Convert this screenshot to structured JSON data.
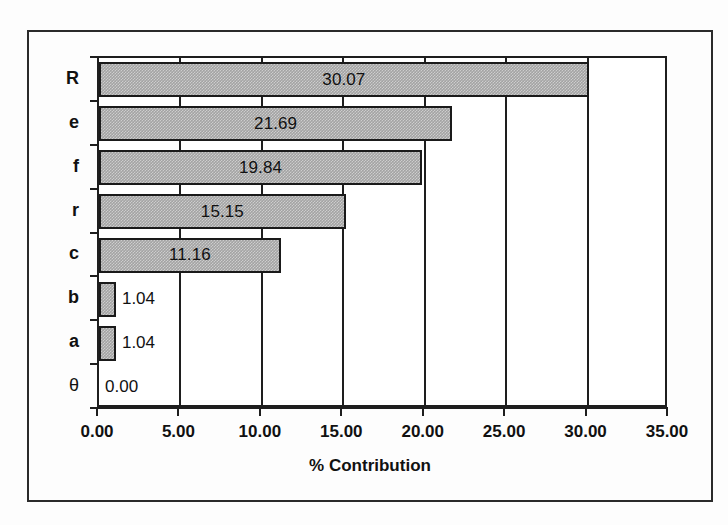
{
  "chart_data": {
    "type": "bar",
    "orientation": "horizontal",
    "title": "",
    "xlabel": "% Contribution",
    "ylabel": "",
    "categories": [
      "R",
      "e",
      "f",
      "r",
      "c",
      "b",
      "a",
      "θ"
    ],
    "values": [
      30.07,
      21.69,
      19.84,
      15.15,
      11.16,
      1.04,
      1.04,
      0.0
    ],
    "value_labels": [
      "30.07",
      "21.69",
      "19.84",
      "15.15",
      "11.16",
      "1.04",
      "1.04",
      "0.00"
    ],
    "xlim": [
      0,
      35
    ],
    "xticks": [
      0,
      5,
      10,
      15,
      20,
      25,
      30,
      35
    ],
    "xtick_labels": [
      "0.00",
      "5.00",
      "10.00",
      "15.00",
      "20.00",
      "25.00",
      "30.00",
      "35.00"
    ],
    "grid": "vertical",
    "legend": "none",
    "bar_fill_color": "#a3a3a3",
    "bar_border_color": "#1a1a1a",
    "axis_color": "#1e1e1e",
    "background_color": "#ffffff"
  }
}
